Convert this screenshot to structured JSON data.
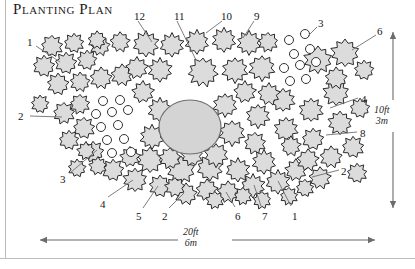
{
  "title": "Planting Plan",
  "colors": {
    "shrub_fill": "#dcdcdc",
    "shrub_stroke": "#2b2b2b",
    "pond_fill": "#d4d4d4",
    "pond_stroke": "#6e6e6e",
    "circle_fill": "#ffffff",
    "circle_stroke": "#333333",
    "leader_line": "#6f6f6f",
    "arrow": "#6b6b6b",
    "frame": "#bbbbbb",
    "text": "#161616"
  },
  "dimensions": {
    "width": {
      "feet": "20ft",
      "meters": "6m",
      "orientation": "horizontal",
      "arrow": "double-headed"
    },
    "height": {
      "feet": "10ft",
      "meters": "3m",
      "orientation": "vertical",
      "arrow": "double-headed"
    }
  },
  "callouts": [
    {
      "label": "1",
      "x": 27,
      "y": 37,
      "lx1": 36,
      "ly1": 46,
      "lx2": 60,
      "ly2": 62
    },
    {
      "label": "12",
      "x": 134,
      "y": 11,
      "lx1": 138,
      "ly1": 21,
      "lx2": 152,
      "ly2": 42
    },
    {
      "label": "11",
      "x": 174,
      "y": 11,
      "lx1": 177,
      "ly1": 21,
      "lx2": 196,
      "ly2": 60
    },
    {
      "label": "10",
      "x": 221,
      "y": 11,
      "lx1": 222,
      "ly1": 21,
      "lx2": 206,
      "ly2": 33
    },
    {
      "label": "9",
      "x": 254,
      "y": 11,
      "lx1": 254,
      "ly1": 21,
      "lx2": 243,
      "ly2": 38
    },
    {
      "label": "3",
      "x": 318,
      "y": 18,
      "lx1": 317,
      "ly1": 27,
      "lx2": 308,
      "ly2": 36
    },
    {
      "label": "6",
      "x": 377,
      "y": 26,
      "lx1": 376,
      "ly1": 35,
      "lx2": 352,
      "ly2": 50
    },
    {
      "label": "2",
      "x": 18,
      "y": 111,
      "lx1": 30,
      "ly1": 116,
      "lx2": 62,
      "ly2": 117
    },
    {
      "label": "4",
      "x": 361,
      "y": 94,
      "lx1": 358,
      "ly1": 98,
      "lx2": 330,
      "ly2": 108
    },
    {
      "label": "8",
      "x": 360,
      "y": 128,
      "lx1": 357,
      "ly1": 132,
      "lx2": 326,
      "ly2": 135
    },
    {
      "label": "2",
      "x": 341,
      "y": 166,
      "lx1": 339,
      "ly1": 170,
      "lx2": 312,
      "ly2": 177
    },
    {
      "label": "3",
      "x": 60,
      "y": 174,
      "lx1": 70,
      "ly1": 173,
      "lx2": 97,
      "ly2": 150
    },
    {
      "label": "4",
      "x": 100,
      "y": 199,
      "lx1": 108,
      "ly1": 197,
      "lx2": 133,
      "ly2": 180
    },
    {
      "label": "5",
      "x": 136,
      "y": 211,
      "lx1": 143,
      "ly1": 208,
      "lx2": 158,
      "ly2": 186
    },
    {
      "label": "2",
      "x": 162,
      "y": 211,
      "lx1": 169,
      "ly1": 208,
      "lx2": 184,
      "ly2": 193
    },
    {
      "label": "6",
      "x": 235,
      "y": 211,
      "lx1": 235,
      "ly1": 207,
      "lx2": 226,
      "ly2": 192
    },
    {
      "label": "7",
      "x": 262,
      "y": 211,
      "lx1": 261,
      "ly1": 206,
      "lx2": 254,
      "ly2": 185
    },
    {
      "label": "1",
      "x": 292,
      "y": 211,
      "lx1": 291,
      "ly1": 206,
      "lx2": 278,
      "ly2": 181
    }
  ],
  "pond": {
    "name": "central-feature",
    "cx": 190,
    "cy": 127,
    "rx": 31,
    "ry": 27
  },
  "open_circles": [
    {
      "cx": 103,
      "cy": 101,
      "r": 4.5
    },
    {
      "cx": 120,
      "cy": 100,
      "r": 4.5
    },
    {
      "cx": 96,
      "cy": 114,
      "r": 4.5
    },
    {
      "cx": 112,
      "cy": 112,
      "r": 4.5
    },
    {
      "cx": 128,
      "cy": 110,
      "r": 4.5
    },
    {
      "cx": 101,
      "cy": 127,
      "r": 4.5
    },
    {
      "cx": 118,
      "cy": 125,
      "r": 4.5
    },
    {
      "cx": 107,
      "cy": 140,
      "r": 4.5
    },
    {
      "cx": 124,
      "cy": 139,
      "r": 4.5
    },
    {
      "cx": 112,
      "cy": 153,
      "r": 4.5
    },
    {
      "cx": 131,
      "cy": 152,
      "r": 4.5
    },
    {
      "cx": 289,
      "cy": 40,
      "r": 4.5
    },
    {
      "cx": 305,
      "cy": 34,
      "r": 4.5
    },
    {
      "cx": 294,
      "cy": 54,
      "r": 4.5
    },
    {
      "cx": 310,
      "cy": 49,
      "r": 4.5
    },
    {
      "cx": 284,
      "cy": 68,
      "r": 4.5
    },
    {
      "cx": 300,
      "cy": 65,
      "r": 4.5
    },
    {
      "cx": 316,
      "cy": 62,
      "r": 4.5
    },
    {
      "cx": 290,
      "cy": 81,
      "r": 4.5
    },
    {
      "cx": 306,
      "cy": 79,
      "r": 4.5
    }
  ],
  "shrubs": [
    {
      "cx": 52,
      "cy": 46,
      "r": 11,
      "lobes": 9
    },
    {
      "cx": 74,
      "cy": 43,
      "r": 10,
      "lobes": 9
    },
    {
      "cx": 44,
      "cy": 66,
      "r": 11,
      "lobes": 9
    },
    {
      "cx": 66,
      "cy": 63,
      "r": 11,
      "lobes": 9
    },
    {
      "cx": 87,
      "cy": 60,
      "r": 10,
      "lobes": 9
    },
    {
      "cx": 58,
      "cy": 84,
      "r": 11,
      "lobes": 9
    },
    {
      "cx": 80,
      "cy": 82,
      "r": 10,
      "lobes": 9
    },
    {
      "cx": 100,
      "cy": 46,
      "r": 10,
      "lobes": 9
    },
    {
      "cx": 101,
      "cy": 78,
      "r": 11,
      "lobes": 9
    },
    {
      "cx": 122,
      "cy": 75,
      "r": 11,
      "lobes": 9
    },
    {
      "cx": 97,
      "cy": 40,
      "r": 9,
      "lobes": 9
    },
    {
      "cx": 120,
      "cy": 42,
      "r": 10,
      "lobes": 9
    },
    {
      "cx": 146,
      "cy": 44,
      "r": 13,
      "lobes": 10
    },
    {
      "cx": 172,
      "cy": 45,
      "r": 12,
      "lobes": 10
    },
    {
      "cx": 137,
      "cy": 68,
      "r": 11,
      "lobes": 9
    },
    {
      "cx": 160,
      "cy": 70,
      "r": 12,
      "lobes": 10
    },
    {
      "cx": 197,
      "cy": 42,
      "r": 12,
      "lobes": 10
    },
    {
      "cx": 224,
      "cy": 40,
      "r": 12,
      "lobes": 10
    },
    {
      "cx": 249,
      "cy": 43,
      "r": 12,
      "lobes": 10
    },
    {
      "cx": 203,
      "cy": 72,
      "r": 15,
      "lobes": 11
    },
    {
      "cx": 235,
      "cy": 70,
      "r": 13,
      "lobes": 10
    },
    {
      "cx": 262,
      "cy": 68,
      "r": 13,
      "lobes": 10
    },
    {
      "cx": 268,
      "cy": 42,
      "r": 10,
      "lobes": 9
    },
    {
      "cx": 64,
      "cy": 113,
      "r": 11,
      "lobes": 9
    },
    {
      "cx": 80,
      "cy": 104,
      "r": 10,
      "lobes": 9
    },
    {
      "cx": 84,
      "cy": 128,
      "r": 11,
      "lobes": 9
    },
    {
      "cx": 69,
      "cy": 140,
      "r": 10,
      "lobes": 9
    },
    {
      "cx": 93,
      "cy": 152,
      "r": 11,
      "lobes": 9
    },
    {
      "cx": 113,
      "cy": 170,
      "r": 11,
      "lobes": 9
    },
    {
      "cx": 135,
      "cy": 180,
      "r": 12,
      "lobes": 10
    },
    {
      "cx": 150,
      "cy": 160,
      "r": 13,
      "lobes": 10
    },
    {
      "cx": 160,
      "cy": 186,
      "r": 11,
      "lobes": 9
    },
    {
      "cx": 181,
      "cy": 170,
      "r": 14,
      "lobes": 10
    },
    {
      "cx": 186,
      "cy": 194,
      "r": 11,
      "lobes": 9
    },
    {
      "cx": 207,
      "cy": 190,
      "r": 11,
      "lobes": 9
    },
    {
      "cx": 228,
      "cy": 192,
      "r": 11,
      "lobes": 9
    },
    {
      "cx": 210,
      "cy": 168,
      "r": 13,
      "lobes": 10
    },
    {
      "cx": 238,
      "cy": 170,
      "r": 12,
      "lobes": 10
    },
    {
      "cx": 253,
      "cy": 186,
      "r": 12,
      "lobes": 10
    },
    {
      "cx": 278,
      "cy": 182,
      "r": 12,
      "lobes": 10
    },
    {
      "cx": 296,
      "cy": 170,
      "r": 11,
      "lobes": 9
    },
    {
      "cx": 264,
      "cy": 162,
      "r": 12,
      "lobes": 10
    },
    {
      "cx": 160,
      "cy": 110,
      "r": 12,
      "lobes": 10
    },
    {
      "cx": 152,
      "cy": 137,
      "r": 12,
      "lobes": 10
    },
    {
      "cx": 170,
      "cy": 158,
      "r": 11,
      "lobes": 9
    },
    {
      "cx": 225,
      "cy": 105,
      "r": 12,
      "lobes": 10
    },
    {
      "cx": 232,
      "cy": 133,
      "r": 13,
      "lobes": 10
    },
    {
      "cx": 216,
      "cy": 155,
      "r": 12,
      "lobes": 10
    },
    {
      "cx": 258,
      "cy": 116,
      "r": 12,
      "lobes": 10
    },
    {
      "cx": 255,
      "cy": 143,
      "r": 11,
      "lobes": 9
    },
    {
      "cx": 283,
      "cy": 100,
      "r": 12,
      "lobes": 10
    },
    {
      "cx": 286,
      "cy": 129,
      "r": 12,
      "lobes": 10
    },
    {
      "cx": 311,
      "cy": 110,
      "r": 12,
      "lobes": 10
    },
    {
      "cx": 313,
      "cy": 139,
      "r": 11,
      "lobes": 9
    },
    {
      "cx": 336,
      "cy": 93,
      "r": 13,
      "lobes": 10
    },
    {
      "cx": 340,
      "cy": 123,
      "r": 12,
      "lobes": 10
    },
    {
      "cx": 345,
      "cy": 53,
      "r": 14,
      "lobes": 10
    },
    {
      "cx": 318,
      "cy": 60,
      "r": 14,
      "lobes": 10
    },
    {
      "cx": 336,
      "cy": 78,
      "r": 11,
      "lobes": 9
    },
    {
      "cx": 331,
      "cy": 157,
      "r": 11,
      "lobes": 9
    },
    {
      "cx": 308,
      "cy": 160,
      "r": 11,
      "lobes": 9
    },
    {
      "cx": 320,
      "cy": 178,
      "r": 11,
      "lobes": 9
    },
    {
      "cx": 291,
      "cy": 146,
      "r": 10,
      "lobes": 9
    },
    {
      "cx": 269,
      "cy": 94,
      "r": 11,
      "lobes": 9
    },
    {
      "cx": 245,
      "cy": 92,
      "r": 11,
      "lobes": 9
    },
    {
      "cx": 143,
      "cy": 92,
      "r": 11,
      "lobes": 9
    },
    {
      "cx": 130,
      "cy": 157,
      "r": 10,
      "lobes": 9
    },
    {
      "cx": 98,
      "cy": 166,
      "r": 9,
      "lobes": 9
    },
    {
      "cx": 86,
      "cy": 151,
      "r": 9,
      "lobes": 9
    },
    {
      "cx": 192,
      "cy": 155,
      "r": 11,
      "lobes": 9
    },
    {
      "cx": 175,
      "cy": 187,
      "r": 10,
      "lobes": 9
    },
    {
      "cx": 215,
      "cy": 200,
      "r": 9,
      "lobes": 9
    },
    {
      "cx": 243,
      "cy": 196,
      "r": 9,
      "lobes": 9
    },
    {
      "cx": 262,
      "cy": 200,
      "r": 9,
      "lobes": 9
    },
    {
      "cx": 289,
      "cy": 196,
      "r": 9,
      "lobes": 9
    },
    {
      "cx": 305,
      "cy": 188,
      "r": 9,
      "lobes": 9
    },
    {
      "cx": 353,
      "cy": 147,
      "r": 11,
      "lobes": 9
    },
    {
      "cx": 357,
      "cy": 173,
      "r": 10,
      "lobes": 9
    },
    {
      "cx": 360,
      "cy": 108,
      "r": 10,
      "lobes": 9
    },
    {
      "cx": 364,
      "cy": 70,
      "r": 10,
      "lobes": 9
    },
    {
      "cx": 40,
      "cy": 104,
      "r": 9,
      "lobes": 9
    },
    {
      "cx": 77,
      "cy": 168,
      "r": 9,
      "lobes": 9
    }
  ]
}
